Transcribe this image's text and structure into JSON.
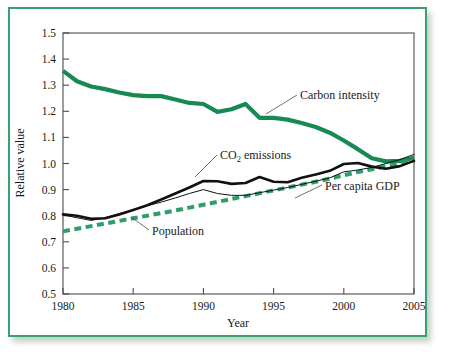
{
  "figure": {
    "frame_color": "#3f9e6f",
    "background": "#ffffff"
  },
  "chart_data": {
    "type": "line",
    "title": "",
    "xlabel": "Year",
    "ylabel": "Relative value",
    "xlim": [
      1980,
      2005
    ],
    "ylim": [
      0.5,
      1.5
    ],
    "grid": false,
    "legend": "inline-annotations",
    "xticks": [
      1980,
      1985,
      1990,
      1995,
      2000,
      2005
    ],
    "xtick_labels": [
      "1980",
      "1985",
      "1990",
      "1995",
      "2000",
      "2005"
    ],
    "yticks": [
      0.5,
      0.6,
      0.7,
      0.8,
      0.9,
      1.0,
      1.1,
      1.2,
      1.3,
      1.4,
      1.5
    ],
    "ytick_labels": [
      "0.5",
      "0.6",
      "0.7",
      "0.8",
      "0.9",
      "1.0",
      "1.1",
      "1.2",
      "1.3",
      "1.4",
      "1.5"
    ],
    "x": [
      1980,
      1981,
      1982,
      1983,
      1984,
      1985,
      1986,
      1987,
      1988,
      1989,
      1990,
      1991,
      1992,
      1993,
      1994,
      1995,
      1996,
      1997,
      1998,
      1999,
      2000,
      2001,
      2002,
      2003,
      2004,
      2005
    ],
    "series": [
      {
        "name": "Carbon intensity",
        "color": "#178a52",
        "style": "solid-thick",
        "values": [
          1.355,
          1.315,
          1.295,
          1.285,
          1.272,
          1.262,
          1.258,
          1.258,
          1.245,
          1.232,
          1.228,
          1.198,
          1.208,
          1.228,
          1.175,
          1.175,
          1.168,
          1.155,
          1.14,
          1.118,
          1.088,
          1.055,
          1.02,
          1.008,
          1.01,
          1.022
        ]
      },
      {
        "name": "CO2 emissions",
        "color": "#111111",
        "style": "solid-thick",
        "values": [
          0.805,
          0.8,
          0.788,
          0.79,
          0.805,
          0.822,
          0.84,
          0.862,
          0.885,
          0.908,
          0.933,
          0.932,
          0.922,
          0.925,
          0.948,
          0.93,
          0.928,
          0.945,
          0.958,
          0.972,
          0.998,
          1.002,
          0.988,
          0.98,
          0.99,
          1.01
        ]
      },
      {
        "name": "Per capita GDP",
        "color": "#111111",
        "style": "solid-thin",
        "values": [
          0.803,
          0.792,
          0.782,
          0.792,
          0.808,
          0.822,
          0.838,
          0.852,
          0.868,
          0.885,
          0.9,
          0.885,
          0.878,
          0.878,
          0.888,
          0.898,
          0.908,
          0.92,
          0.932,
          0.945,
          0.968,
          0.975,
          0.985,
          1.0,
          1.015,
          1.035
        ]
      },
      {
        "name": "Population",
        "color": "#2f9c6a",
        "style": "dashed",
        "values": [
          0.74,
          0.75,
          0.76,
          0.77,
          0.78,
          0.79,
          0.8,
          0.81,
          0.82,
          0.831,
          0.842,
          0.853,
          0.864,
          0.875,
          0.886,
          0.897,
          0.908,
          0.919,
          0.93,
          0.942,
          0.955,
          0.967,
          0.978,
          0.99,
          1.0,
          1.012
        ]
      }
    ],
    "annotations": [
      {
        "name": "carbon-intensity-label",
        "text": "Carbon intensity",
        "x": 1992.8,
        "y": 1.248
      },
      {
        "name": "co2-emissions-label",
        "text": "CO",
        "text_sub": "2",
        "text_tail": " emissions",
        "x": 1988.4,
        "y": 1.022
      },
      {
        "name": "per-capita-gdp-label",
        "text": "Per capita GDP",
        "x": 1997.6,
        "y": 0.85
      },
      {
        "name": "population-label",
        "text": "Population",
        "x": 1985.9,
        "y": 0.718
      }
    ]
  }
}
